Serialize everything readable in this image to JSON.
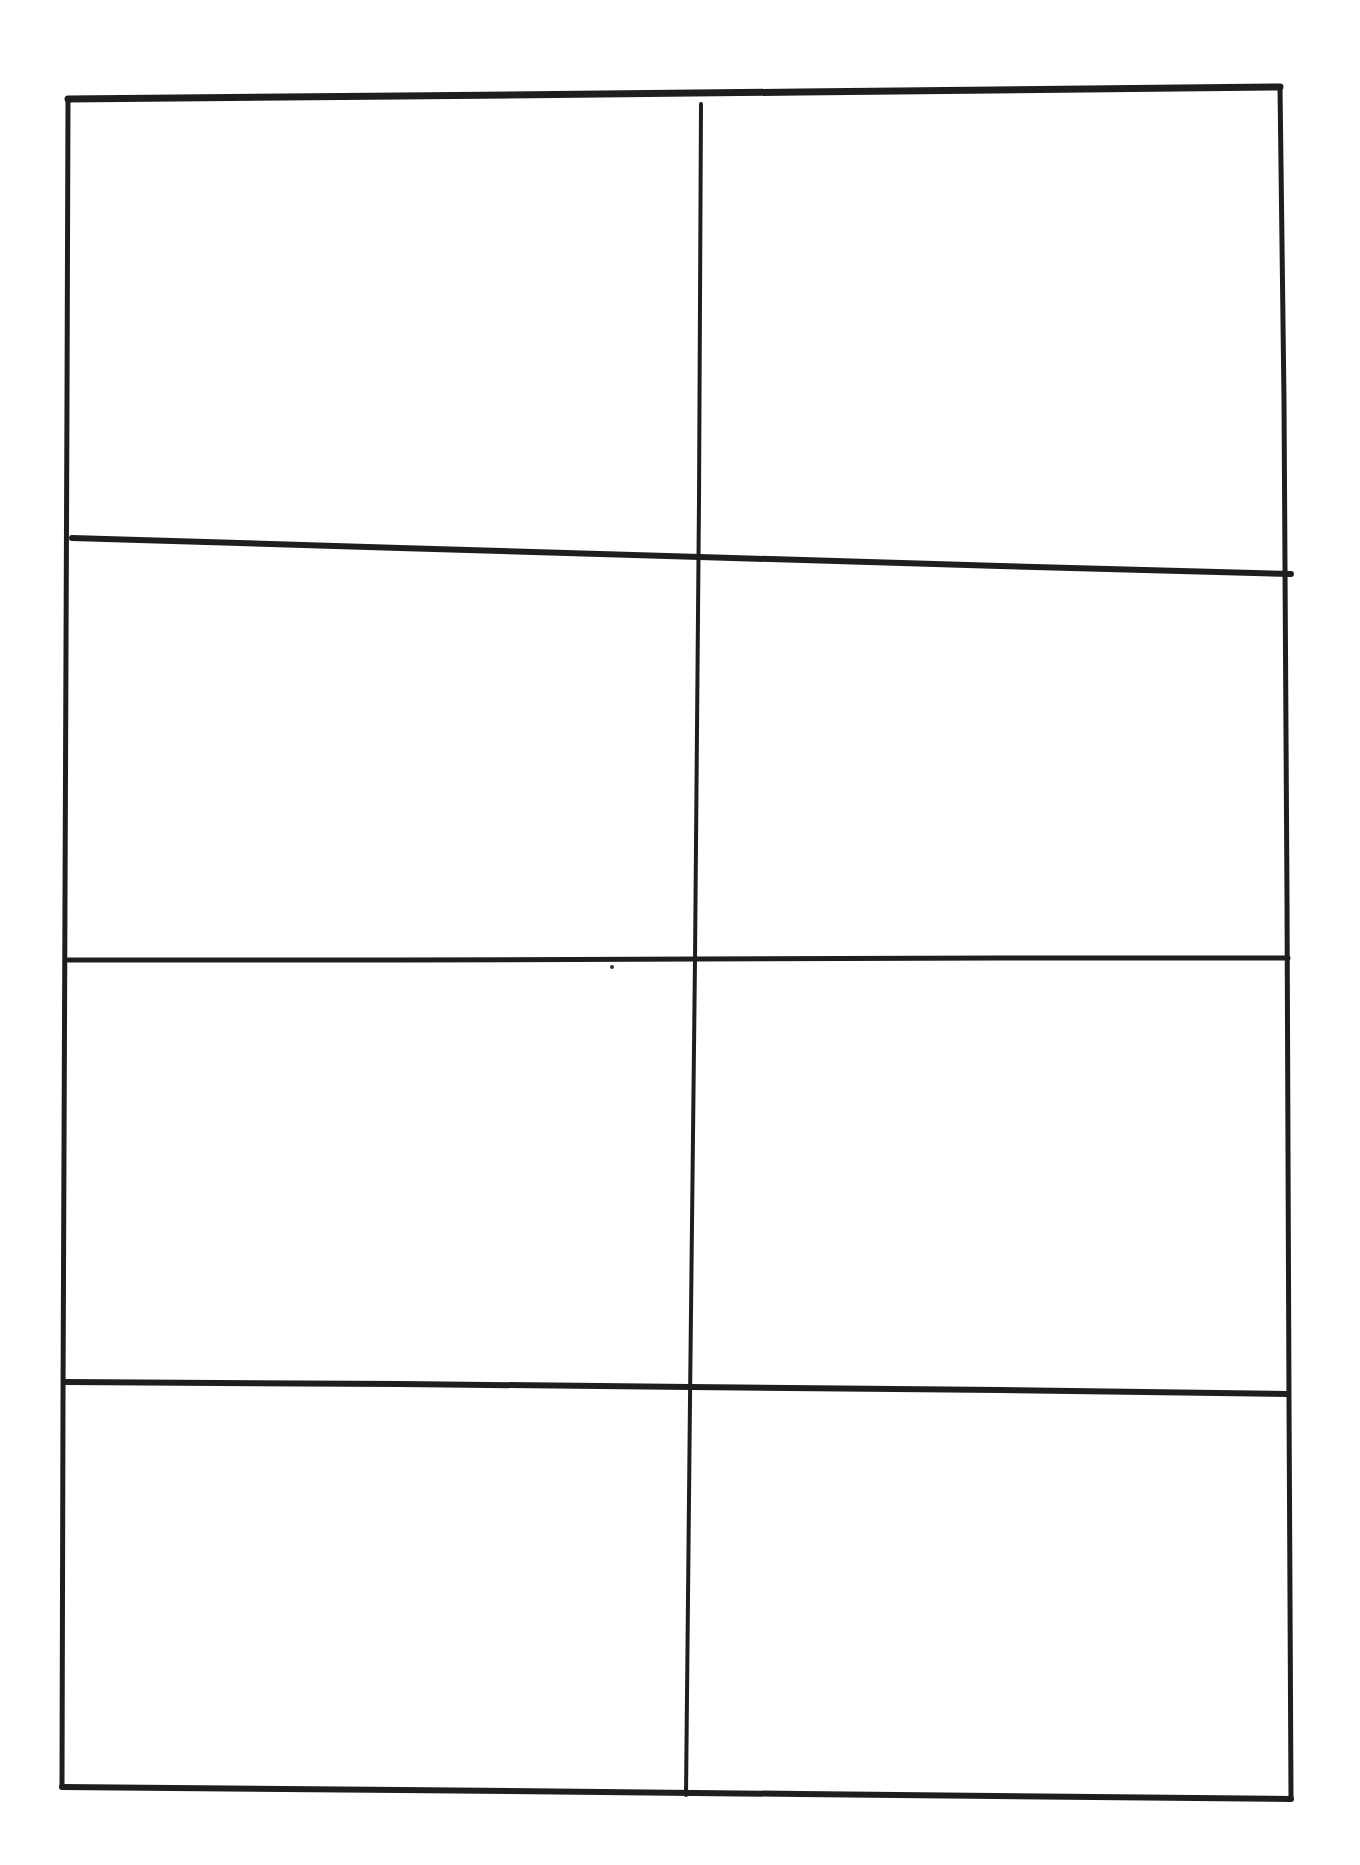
{
  "drawing": {
    "type": "hand-drawn blank grid",
    "rows": 4,
    "columns": 2,
    "stroke_color": "#1e1e1e",
    "background": "#ffffff",
    "lines": {
      "outer_border": [
        [
          68,
          99
        ],
        [
          1280,
          87
        ],
        [
          1291,
          1799
        ],
        [
          62,
          1787
        ]
      ],
      "vertical_divider": [
        [
          700,
          104
        ],
        [
          686,
          1795
        ]
      ],
      "horizontal_dividers": [
        [
          [
            72,
            538
          ],
          [
            1291,
            574
          ]
        ],
        [
          [
            68,
            960
          ],
          [
            1288,
            958
          ]
        ],
        [
          [
            66,
            1382
          ],
          [
            1288,
            1394
          ]
        ]
      ]
    },
    "cells": [
      {
        "row": 1,
        "col": 1,
        "text": ""
      },
      {
        "row": 1,
        "col": 2,
        "text": ""
      },
      {
        "row": 2,
        "col": 1,
        "text": ""
      },
      {
        "row": 2,
        "col": 2,
        "text": ""
      },
      {
        "row": 3,
        "col": 1,
        "text": ""
      },
      {
        "row": 3,
        "col": 2,
        "text": ""
      },
      {
        "row": 4,
        "col": 1,
        "text": ""
      },
      {
        "row": 4,
        "col": 2,
        "text": ""
      }
    ]
  }
}
